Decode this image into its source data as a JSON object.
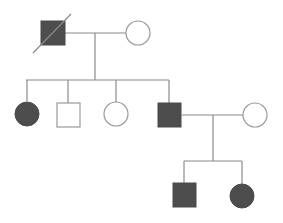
{
  "diagram": {
    "type": "pedigree",
    "colors": {
      "affected_fill": "#4d4d4d",
      "unaffected_fill": "#ffffff",
      "line": "#8a8a8a"
    },
    "generations": [
      {
        "label": "I",
        "individuals": [
          {
            "id": "I-1",
            "sex": "male",
            "affected": true,
            "deceased": true
          },
          {
            "id": "I-2",
            "sex": "female",
            "affected": false,
            "deceased": false
          }
        ]
      },
      {
        "label": "II",
        "individuals": [
          {
            "id": "II-1",
            "sex": "female",
            "affected": true
          },
          {
            "id": "II-2",
            "sex": "male",
            "affected": false
          },
          {
            "id": "II-3",
            "sex": "female",
            "affected": false
          },
          {
            "id": "II-4",
            "sex": "male",
            "affected": true
          },
          {
            "id": "II-5",
            "sex": "female",
            "affected": false,
            "married_in": true
          }
        ]
      },
      {
        "label": "III",
        "individuals": [
          {
            "id": "III-1",
            "sex": "male",
            "affected": true
          },
          {
            "id": "III-2",
            "sex": "female",
            "affected": true
          }
        ]
      }
    ]
  }
}
